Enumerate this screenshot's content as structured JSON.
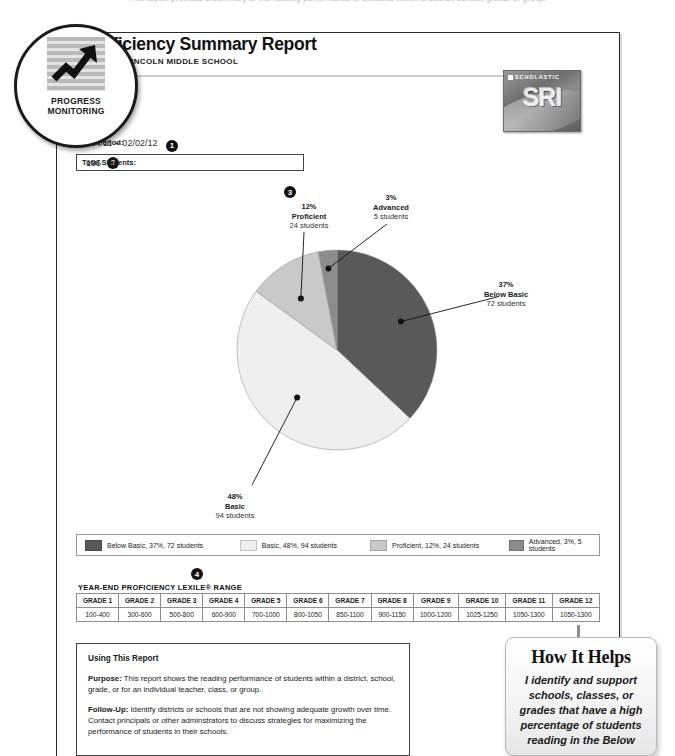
{
  "top_clip_text": "This report provides a summary of the reading performance of students within a district, school, grade, or group.",
  "badge": {
    "line1": "PROGRESS",
    "line2": "MONITORING",
    "icon": "upward-trend-arrow-icon"
  },
  "header": {
    "title": "Proficiency Summary Report",
    "subtitle": "SCHOOL: LINCOLN MIDDLE SCHOOL"
  },
  "logo": {
    "brand": "SCHOLASTIC",
    "product": "SRI"
  },
  "meta": {
    "time_period_label": "Time Period:",
    "time_period_value": "08/24/11 – 02/02/12",
    "time_period_callout": "1",
    "total_students_label": "Total Students:",
    "total_students_value": "195",
    "total_students_callout": "2"
  },
  "chart_callout": "3",
  "lexile_callout": "4",
  "chart_data": {
    "type": "pie",
    "title": "Proficiency Summary",
    "categories": [
      "Below Basic",
      "Basic",
      "Proficient",
      "Advanced"
    ],
    "values": [
      37,
      48,
      12,
      3
    ],
    "counts": [
      72,
      94,
      24,
      5
    ],
    "total_students": 195,
    "unit": "%",
    "colors": [
      "#595959",
      "#efefef",
      "#c9c9c9",
      "#8c8c8c"
    ],
    "legend_position": "bottom",
    "slices": [
      {
        "name": "Below Basic",
        "percent": "37%",
        "count": "72 students",
        "color": "#595959",
        "start_deg": 0,
        "end_deg": 133.2
      },
      {
        "name": "Basic",
        "percent": "48%",
        "count": "94 students",
        "color": "#efefef",
        "start_deg": 133.2,
        "end_deg": 306.0
      },
      {
        "name": "Proficient",
        "percent": "12%",
        "count": "24 students",
        "color": "#c9c9c9",
        "start_deg": 306.0,
        "end_deg": 349.2
      },
      {
        "name": "Advanced",
        "percent": "3%",
        "count": "5 students",
        "color": "#8c8c8c",
        "start_deg": 349.2,
        "end_deg": 360
      }
    ],
    "legend": [
      {
        "label": "Below Basic, 37%, 72 students",
        "color": "#595959"
      },
      {
        "label": "Basic, 48%, 94 students",
        "color": "#efefef"
      },
      {
        "label": "Proficient, 12%, 24 students",
        "color": "#c9c9c9"
      },
      {
        "label": "Advanced, 3%, 5 students",
        "color": "#8c8c8c"
      }
    ]
  },
  "lexile": {
    "title": "YEAR-END PROFICIENCY LEXILE® RANGE",
    "grades": [
      "GRADE 1",
      "GRADE 2",
      "GRADE 3",
      "GRADE 4",
      "GRADE 5",
      "GRADE 6",
      "GRADE 7",
      "GRADE 8",
      "GRADE 9",
      "GRADE 10",
      "GRADE 11",
      "GRADE 12"
    ],
    "ranges": [
      "100-400",
      "300-600",
      "500-800",
      "600-900",
      "700-1000",
      "800-1050",
      "850-1100",
      "900-1150",
      "1000-1200",
      "1025-1250",
      "1050-1300",
      "1050-1300"
    ]
  },
  "using_this_report": {
    "heading": "Using This Report",
    "purpose_label": "Purpose:",
    "purpose_text": " This report shows the reading performance of students within a district, school, grade, or for an individual teacher, class, or group.",
    "followup_label": "Follow-Up:",
    "followup_text": " Identify districts or schools that are not showing adequate growth over time. Contact principals or other adminstrators to discuss strategies for maximizing the performance of students in their schools."
  },
  "how_it_helps": {
    "heading": "How It Helps",
    "body": "I identify and support schools, classes, or grades that have a high percentage of students reading in the Below"
  }
}
